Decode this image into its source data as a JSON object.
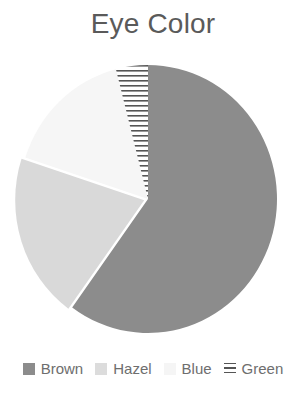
{
  "chart_data": {
    "type": "pie",
    "title": "Eye Color",
    "categories": [
      "Brown",
      "Hazel",
      "Blue",
      "Green"
    ],
    "values": [
      60,
      20,
      16,
      4
    ],
    "unit": "percent (estimated from slice angles)",
    "colors": [
      "#8c8c8c",
      "#d9d9d9",
      "#f6f6f6",
      "hatched-horizontal-lines"
    ],
    "start_angle": "12 o'clock, clockwise",
    "legend_position": "bottom",
    "exploded": [
      "Hazel"
    ]
  },
  "legend": {
    "items": [
      {
        "label": "Brown",
        "color": "#8c8c8c"
      },
      {
        "label": "Hazel",
        "color": "#d9d9d9"
      },
      {
        "label": "Blue",
        "color": "#f6f6f6"
      },
      {
        "label": "Green",
        "pattern": "horizontal-lines"
      }
    ]
  }
}
